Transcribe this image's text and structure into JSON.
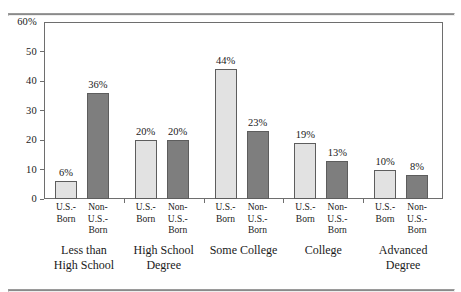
{
  "chart_data": {
    "type": "bar",
    "title": "",
    "subtitle": "",
    "xlabel": "",
    "ylabel": "",
    "ylim": [
      0,
      60
    ],
    "yticks": [
      0,
      10,
      20,
      30,
      40,
      50,
      60
    ],
    "ytick_labels": [
      "0",
      "10",
      "20",
      "30",
      "40",
      "50",
      "60%"
    ],
    "grid": false,
    "legend_position": "none",
    "categories": [
      "Less than High School",
      "High School Degree",
      "Some College",
      "College",
      "Advanced Degree"
    ],
    "category_lines": [
      [
        "Less than",
        "High School"
      ],
      [
        "High School",
        "Degree"
      ],
      [
        "Some College",
        ""
      ],
      [
        "College",
        ""
      ],
      [
        "Advanced",
        "Degree"
      ]
    ],
    "series": [
      {
        "name": "U.S.-Born",
        "name_lines": [
          "U.S.-",
          "Born",
          ""
        ],
        "color": "#e2e2e2",
        "values": [
          6,
          20,
          44,
          19,
          10
        ],
        "data_labels": [
          "6%",
          "20%",
          "44%",
          "19%",
          "10%"
        ]
      },
      {
        "name": "Non-U.S.-Born",
        "name_lines": [
          "Non-",
          "U.S.-",
          "Born"
        ],
        "color": "#7e7e7e",
        "values": [
          36,
          20,
          23,
          13,
          8
        ],
        "data_labels": [
          "36%",
          "20%",
          "23%",
          "13%",
          "8%"
        ]
      }
    ]
  },
  "colors": {
    "us_born_bar": "#e2e2e2",
    "non_us_born_bar": "#7e7e7e",
    "bar_outline": "#5d5d5d",
    "axis": "#6e6e6e",
    "rule": "#8a8a8a",
    "text": "#1a1a1a",
    "background": "#ffffff"
  }
}
